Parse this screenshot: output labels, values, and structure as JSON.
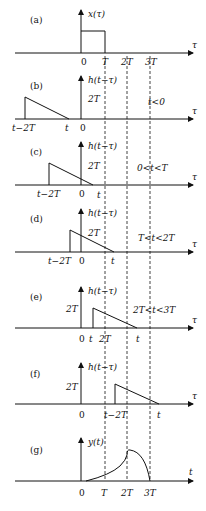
{
  "figure": {
    "x_positions": {
      "origin": 81,
      "T": 105,
      "twoT": 127,
      "threeT": 150
    },
    "dashed_lines": [
      "T",
      "2T",
      "3T"
    ],
    "panels": [
      {
        "id": "a",
        "tag": "(a)",
        "axis_y": 53,
        "ylabel": "x(τ)",
        "xaxis_label": "τ",
        "tick_labels": [
          "0",
          "T",
          "2T",
          "3T"
        ],
        "shape": "rectangle from 0 to T",
        "condition": ""
      },
      {
        "id": "b",
        "tag": "(b)",
        "axis_y": 119,
        "ylabel": "h(t−τ)",
        "xaxis_label": "τ",
        "height_label": "2T",
        "tick_labels": [
          "t−2T",
          "t",
          "0"
        ],
        "shape": "triangle from t−2T to t",
        "condition": "t<0"
      },
      {
        "id": "c",
        "tag": "(c)",
        "axis_y": 185,
        "ylabel": "h(t−τ)",
        "xaxis_label": "τ",
        "height_label": "2T",
        "tick_labels": [
          "t−2T",
          "0",
          "t"
        ],
        "shape": "triangle from t−2T to t",
        "condition": "0<t<T"
      },
      {
        "id": "d",
        "tag": "(d)",
        "axis_y": 252,
        "ylabel": "h(t−τ)",
        "xaxis_label": "τ",
        "height_label": "2T",
        "tick_labels": [
          "t−2T",
          "0",
          "t"
        ],
        "shape": "triangle from t−2T to t",
        "condition": "T<t<2T"
      },
      {
        "id": "e",
        "tag": "(e)",
        "axis_y": 328,
        "ylabel": "h(t−τ)",
        "xaxis_label": "τ",
        "height_label": "2T",
        "tick_labels": [
          "0",
          "t",
          "2T",
          "t"
        ],
        "shape": "triangle from t−2T to t",
        "condition": "2T<t<3T"
      },
      {
        "id": "f",
        "tag": "(f)",
        "axis_y": 404,
        "ylabel": "h(t−τ)",
        "xaxis_label": "τ",
        "height_label": "2T",
        "tick_labels": [
          "0",
          "t−2T",
          "t"
        ],
        "shape": "triangle from t−2T to t",
        "condition": ""
      },
      {
        "id": "g",
        "tag": "(g)",
        "axis_y": 481,
        "ylabel": "y(t)",
        "xaxis_label": "t",
        "tick_labels": [
          "0",
          "T",
          "2T",
          "3T"
        ],
        "shape": "rising curve 0→2T then falling curve 2T→3T",
        "condition": ""
      }
    ]
  }
}
